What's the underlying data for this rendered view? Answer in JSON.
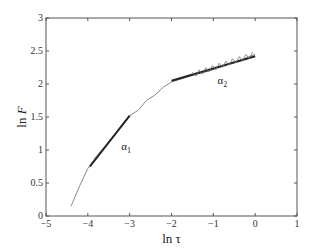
{
  "chart_data": {
    "type": "line",
    "title": "",
    "xlabel": "ln τ",
    "ylabel": "ln F",
    "xlim": [
      -5,
      1
    ],
    "ylim": [
      0,
      3
    ],
    "xticks": [
      "-5",
      "-4",
      "-3",
      "-2",
      "-1",
      "0",
      "1"
    ],
    "yticks": [
      "0",
      "0.5",
      "1",
      "1.5",
      "2",
      "2.5",
      "3"
    ],
    "grid": false,
    "legend": null,
    "series": [
      {
        "name": "data",
        "color": "#888888",
        "x": [
          -4.4,
          -4.2,
          -4.0,
          -3.8,
          -3.6,
          -3.4,
          -3.2,
          -3.0,
          -2.8,
          -2.6,
          -2.4,
          -2.2,
          -2.0,
          -1.8,
          -1.5,
          -1.2,
          -1.0,
          -0.8,
          -0.5,
          -0.2,
          0.0
        ],
        "y": [
          0.15,
          0.45,
          0.72,
          0.9,
          1.05,
          1.2,
          1.35,
          1.52,
          1.6,
          1.75,
          1.83,
          1.95,
          2.03,
          2.07,
          2.13,
          2.18,
          2.22,
          2.27,
          2.33,
          2.4,
          2.45
        ]
      },
      {
        "name": "fit α1",
        "color": "#222222",
        "x": [
          -3.95,
          -3.0
        ],
        "y": [
          0.75,
          1.52
        ]
      },
      {
        "name": "fit α2",
        "color": "#222222",
        "x": [
          -2.0,
          0.0
        ],
        "y": [
          2.05,
          2.42
        ]
      }
    ],
    "annotations": [
      {
        "text": "α",
        "sub": "1",
        "x": -3.2,
        "y": 1.0
      },
      {
        "text": "α",
        "sub": "2",
        "x": -0.9,
        "y": 2.0
      }
    ]
  }
}
